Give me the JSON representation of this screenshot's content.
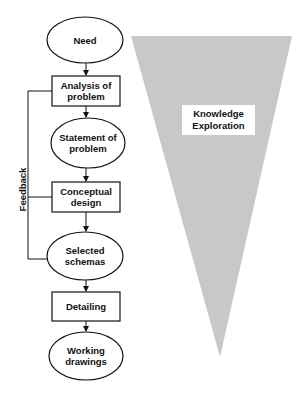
{
  "diagram": {
    "nodes": [
      {
        "id": "need",
        "shape": "ellipse",
        "label": "Need"
      },
      {
        "id": "analysis",
        "shape": "rect",
        "label": "Analysis of\nproblem"
      },
      {
        "id": "statement",
        "shape": "ellipse",
        "label": "Statement of\nproblem"
      },
      {
        "id": "conceptual",
        "shape": "rect",
        "label": "Conceptual\ndesign"
      },
      {
        "id": "selected",
        "shape": "ellipse",
        "label": "Selected\nschemas"
      },
      {
        "id": "detailing",
        "shape": "rect",
        "label": "Detailing"
      },
      {
        "id": "working",
        "shape": "ellipse",
        "label": "Working\ndrawings"
      }
    ],
    "feedback_label": "Feedback",
    "knowledge_label": "Knowledge\nExploration",
    "colors": {
      "stroke": "#111111",
      "triangle_fill": "#c8c8c8",
      "background": "#ffffff"
    }
  }
}
